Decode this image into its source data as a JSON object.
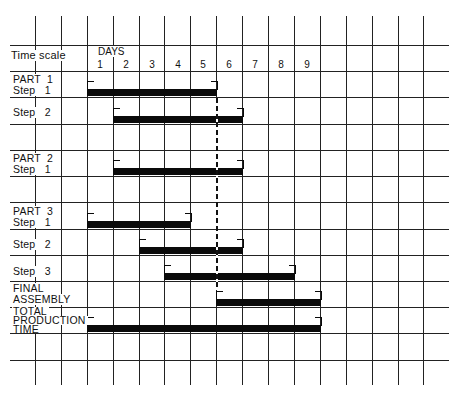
{
  "chart_data": {
    "type": "gantt",
    "title": "",
    "header_label": "Time scale",
    "axis_title": "DAYS",
    "categories": [
      "1",
      "2",
      "3",
      "4",
      "5",
      "6",
      "7",
      "8",
      "9"
    ],
    "tasks": [
      {
        "label": "PART 1\nStep 1",
        "start_day": 1,
        "end_day": 5
      },
      {
        "label": "Step 2",
        "start_day": 2,
        "end_day": 6
      },
      {
        "label": "PART 2\nStep 1",
        "start_day": 2,
        "end_day": 6
      },
      {
        "label": "PART 3\nStep 1",
        "start_day": 1,
        "end_day": 4
      },
      {
        "label": "Step 2",
        "start_day": 3,
        "end_day": 6
      },
      {
        "label": "Step 3",
        "start_day": 4,
        "end_day": 8
      },
      {
        "label": "FINAL\nASSEMBLY",
        "start_day": 6,
        "end_day": 9
      },
      {
        "label": "TOTAL\nPRODUCTION\nTIME",
        "start_day": 1,
        "end_day": 9
      }
    ],
    "annotations": [
      "dashed vertical line at end of day 5 (start of day 6) linking Part 1 Step 1 completion to Final Assembly start"
    ],
    "grid": true,
    "colors": {
      "bar": "#0a0a0a",
      "grid": "#222222",
      "background": "#ffffff"
    }
  },
  "labels": {
    "time_scale": "Time scale",
    "days": "DAYS",
    "part1": "PART  1",
    "part1_step1": "Step   1",
    "part1_step2": "Step   2",
    "part2": "PART  2",
    "part2_step1": "Step   1",
    "part3": "PART  3",
    "part3_step1": "Step   1",
    "part3_step2": "Step   2",
    "part3_step3": "Step   3",
    "final1": "FINAL",
    "final2": "ASSEMBLY",
    "total1": "TOTAL",
    "total2": "PRODUCTION",
    "total3": "TIME"
  },
  "day_numbers": [
    "1",
    "2",
    "3",
    "4",
    "5",
    "6",
    "7",
    "8",
    "9"
  ]
}
